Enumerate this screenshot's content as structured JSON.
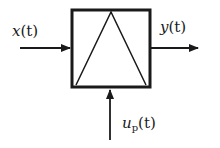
{
  "diagram": {
    "type": "block-diagram",
    "block": {
      "symbol": "triangle-in-square"
    },
    "input_label": {
      "var": "x",
      "arg": "(t)"
    },
    "output_label": {
      "var": "y",
      "arg": "(t)"
    },
    "control_label": {
      "var": "u",
      "sub": "p",
      "arg": "(t)"
    },
    "colors": {
      "stroke": "#1a1a1a",
      "background": "#ffffff"
    }
  }
}
